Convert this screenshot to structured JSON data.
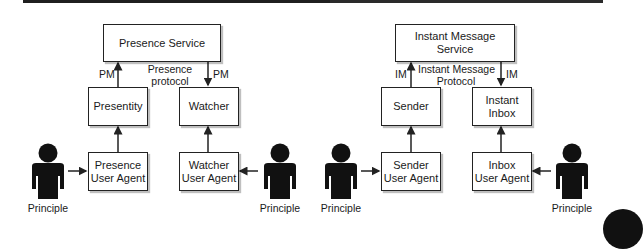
{
  "diagrams": [
    {
      "name": "presence",
      "service": "Presence Service",
      "protocol_label": [
        "Presence",
        "protocol"
      ],
      "left_arrow_label": "PM",
      "right_arrow_label": "PM",
      "left_component": [
        "Presentity"
      ],
      "right_component": [
        "Watcher"
      ],
      "left_agent": [
        "Presence",
        "User Agent"
      ],
      "right_agent": [
        "Watcher",
        "User Agent"
      ],
      "left_principal": "Principle",
      "right_principal": "Principle"
    },
    {
      "name": "instant-message",
      "service": "Instant Message Service",
      "protocol_label": [
        "Instant Message",
        "Protocol"
      ],
      "left_arrow_label": "IM",
      "right_arrow_label": "IM",
      "left_component": [
        "Sender"
      ],
      "right_component": [
        "Instant",
        "Inbox"
      ],
      "left_agent": [
        "Sender",
        "User Agent"
      ],
      "right_agent": [
        "Inbox",
        "User Agent"
      ],
      "left_principal": "Principle",
      "right_principal": "Principle"
    }
  ],
  "colors": {
    "stroke": "#222222",
    "figure": "#111111",
    "background": "#ffffff"
  }
}
